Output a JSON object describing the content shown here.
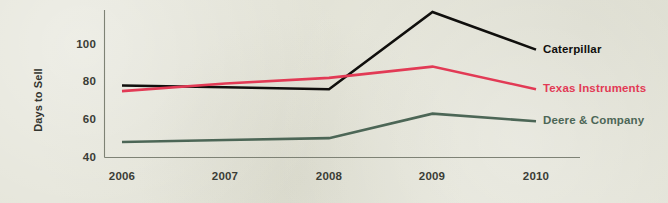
{
  "chart_data": {
    "type": "line",
    "title": "",
    "subtitle": "",
    "xlabel": "",
    "ylabel": "Days to Sell",
    "categories": [
      "2006",
      "2007",
      "2008",
      "2009",
      "2010"
    ],
    "x": [
      2006,
      2007,
      2008,
      2009,
      2010
    ],
    "xlim": [
      2006,
      2010
    ],
    "ylim": [
      40,
      120
    ],
    "yticks": [
      40,
      60,
      80,
      100
    ],
    "ytick_labels": [
      "40",
      "60",
      "80",
      "100"
    ],
    "xtick_labels": [
      "2006",
      "2007",
      "2008",
      "2009",
      "2010"
    ],
    "grid": false,
    "legend_position": "line-end-labels",
    "series": [
      {
        "name": "Caterpillar",
        "color": "#100f0d",
        "values": [
          78,
          77,
          76,
          117,
          97
        ]
      },
      {
        "name": "Texas Instruments",
        "color": "#e23a55",
        "values": [
          75,
          79,
          82,
          88,
          76
        ]
      },
      {
        "name": "Deere & Company",
        "color": "#4c6656",
        "values": [
          48,
          49,
          50,
          63,
          59
        ]
      }
    ],
    "annotations": []
  },
  "style": {
    "background_color": "#e3e3d7",
    "axis_color": "#7e8275",
    "text_color": "#3b3d36"
  }
}
